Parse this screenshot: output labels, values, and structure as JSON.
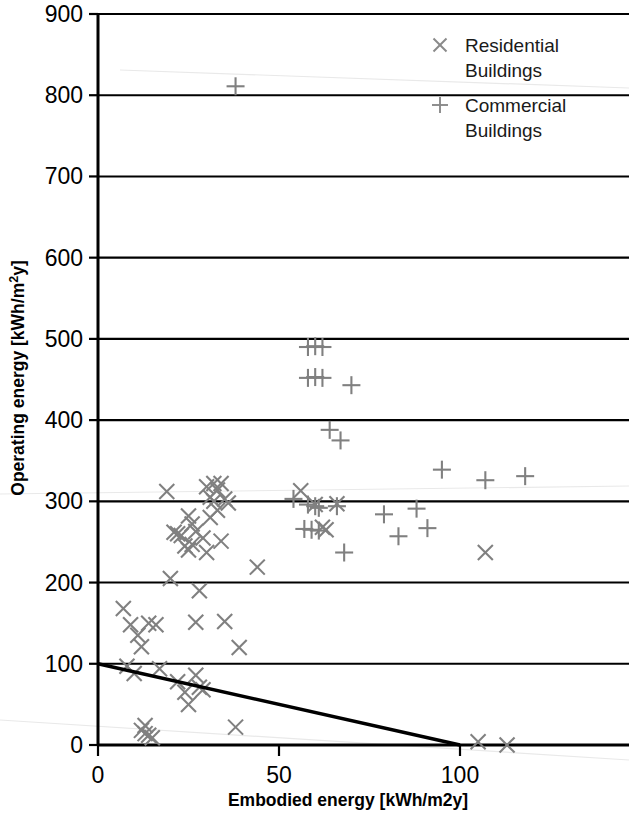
{
  "chart_data": {
    "type": "scatter",
    "title": "",
    "xlabel": "Embodied energy [kWh/m2y]",
    "ylabel": "Operating energy [kWh/m²y]",
    "xlim": [
      0,
      146
    ],
    "ylim": [
      0,
      900
    ],
    "xticks": [
      0,
      50,
      100
    ],
    "yticks": [
      0,
      100,
      200,
      300,
      400,
      500,
      600,
      700,
      800,
      900
    ],
    "grid": true,
    "grid_axis": "y",
    "legend_position": "top-right",
    "marker_color": "#808080",
    "series": [
      {
        "name": "Residential Buildings",
        "marker": "x",
        "points": [
          [
            7,
            168
          ],
          [
            8,
            97
          ],
          [
            9,
            148
          ],
          [
            10,
            88
          ],
          [
            11,
            135
          ],
          [
            12,
            121
          ],
          [
            12,
            18
          ],
          [
            13,
            14
          ],
          [
            13,
            24
          ],
          [
            14,
            12
          ],
          [
            14,
            150
          ],
          [
            15,
            9
          ],
          [
            16,
            148
          ],
          [
            17,
            94
          ],
          [
            19,
            312
          ],
          [
            20,
            205
          ],
          [
            21,
            262
          ],
          [
            22,
            260
          ],
          [
            22,
            78
          ],
          [
            23,
            258
          ],
          [
            24,
            245
          ],
          [
            24,
            65
          ],
          [
            25,
            282
          ],
          [
            25,
            240
          ],
          [
            25,
            50
          ],
          [
            26,
            272
          ],
          [
            26,
            247
          ],
          [
            27,
            263
          ],
          [
            27,
            151
          ],
          [
            27,
            86
          ],
          [
            28,
            190
          ],
          [
            28,
            71
          ],
          [
            29,
            255
          ],
          [
            29,
            68
          ],
          [
            30,
            318
          ],
          [
            30,
            237
          ],
          [
            31,
            305
          ],
          [
            31,
            280
          ],
          [
            32,
            322
          ],
          [
            32,
            300
          ],
          [
            33,
            314
          ],
          [
            33,
            289
          ],
          [
            34,
            322
          ],
          [
            34,
            251
          ],
          [
            35,
            303
          ],
          [
            35,
            152
          ],
          [
            36,
            298
          ],
          [
            38,
            22
          ],
          [
            39,
            120
          ],
          [
            44,
            219
          ],
          [
            56,
            313
          ],
          [
            60,
            296
          ],
          [
            62,
            268
          ],
          [
            63,
            265
          ],
          [
            66,
            297
          ],
          [
            105,
            4
          ],
          [
            107,
            237
          ],
          [
            113,
            0
          ]
        ]
      },
      {
        "name": "Commercial Buildings",
        "marker": "+",
        "points": [
          [
            38,
            811
          ],
          [
            58,
            490
          ],
          [
            60,
            491
          ],
          [
            62,
            490
          ],
          [
            58,
            452
          ],
          [
            60,
            453
          ],
          [
            62,
            452
          ],
          [
            70,
            443
          ],
          [
            64,
            388
          ],
          [
            67,
            375
          ],
          [
            54,
            303
          ],
          [
            58,
            296
          ],
          [
            60,
            294
          ],
          [
            61,
            292
          ],
          [
            57,
            266
          ],
          [
            59,
            265
          ],
          [
            61,
            264
          ],
          [
            66,
            294
          ],
          [
            68,
            237
          ],
          [
            79,
            284
          ],
          [
            83,
            257
          ],
          [
            88,
            291
          ],
          [
            91,
            267
          ],
          [
            95,
            339
          ],
          [
            107,
            326
          ],
          [
            118,
            331
          ]
        ]
      }
    ],
    "trendline": {
      "from": [
        0,
        100
      ],
      "to": [
        100,
        0
      ],
      "color": "#000000"
    }
  },
  "legend": {
    "items": [
      {
        "label_line1": "Residential",
        "label_line2": "Buildings",
        "marker": "x"
      },
      {
        "label_line1": "Commercial",
        "label_line2": "Buildings",
        "marker": "+"
      }
    ]
  }
}
